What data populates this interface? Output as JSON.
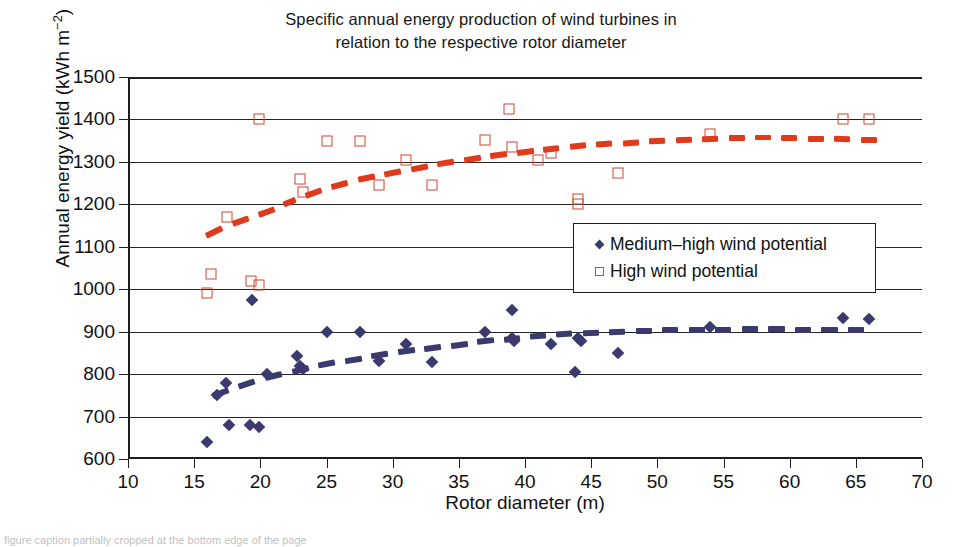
{
  "chart_data": {
    "type": "scatter",
    "title": "Specific annual energy production of wind turbines in relation to the respective rotor diameter",
    "title_lines": [
      "Specific annual energy production of wind turbines in",
      "relation to the respective rotor diameter"
    ],
    "xlabel": "Rotor diameter (m)",
    "ylabel": "Annual energy yield (kWh m⁻²)",
    "ylabel_prefix": "Annual energy yield (kWh m",
    "ylabel_sup": "−2",
    "ylabel_suffix": ")",
    "xlim": [
      10,
      70
    ],
    "ylim": [
      600,
      1500
    ],
    "xticks": [
      10,
      15,
      20,
      25,
      30,
      35,
      40,
      45,
      50,
      55,
      60,
      65,
      70
    ],
    "yticks": [
      600,
      700,
      800,
      900,
      1000,
      1100,
      1200,
      1300,
      1400,
      1500
    ],
    "grid": "horizontal",
    "legend_position": "center-right",
    "colors": {
      "medium_high": "#3a3a6e",
      "high": "#d1472c",
      "high_trend": "#e03a1c",
      "axis": "#1d1d1d"
    },
    "series": [
      {
        "name": "Medium–high wind potential",
        "marker": "filled-diamond",
        "color": "#3a3a6e",
        "points": [
          [
            16.0,
            640
          ],
          [
            16.7,
            750
          ],
          [
            17.4,
            780
          ],
          [
            17.6,
            680
          ],
          [
            19.2,
            680
          ],
          [
            19.4,
            975
          ],
          [
            19.9,
            675
          ],
          [
            20.5,
            800
          ],
          [
            22.8,
            843
          ],
          [
            23.0,
            820
          ],
          [
            23.2,
            812
          ],
          [
            25.0,
            900
          ],
          [
            27.5,
            900
          ],
          [
            29.0,
            830
          ],
          [
            31.0,
            872
          ],
          [
            33.0,
            828
          ],
          [
            37.0,
            900
          ],
          [
            39.0,
            950
          ],
          [
            39.0,
            885
          ],
          [
            39.2,
            878
          ],
          [
            42.0,
            870
          ],
          [
            43.8,
            805
          ],
          [
            44.0,
            885
          ],
          [
            44.2,
            878
          ],
          [
            47.0,
            850
          ],
          [
            54.0,
            910
          ],
          [
            64.0,
            932
          ],
          [
            66.0,
            930
          ]
        ]
      },
      {
        "name": "High wind potential",
        "marker": "open-square",
        "color": "#d1472c",
        "points": [
          [
            16.0,
            990
          ],
          [
            16.3,
            1035
          ],
          [
            17.5,
            1170
          ],
          [
            19.3,
            1020
          ],
          [
            19.9,
            1010
          ],
          [
            19.9,
            1400
          ],
          [
            23.0,
            1260
          ],
          [
            23.2,
            1228
          ],
          [
            25.0,
            1350
          ],
          [
            27.5,
            1350
          ],
          [
            29.0,
            1245
          ],
          [
            31.0,
            1305
          ],
          [
            33.0,
            1245
          ],
          [
            37.0,
            1352
          ],
          [
            38.8,
            1425
          ],
          [
            39.0,
            1335
          ],
          [
            41.0,
            1305
          ],
          [
            42.0,
            1322
          ],
          [
            44.0,
            1212
          ],
          [
            44.0,
            1200
          ],
          [
            47.0,
            1275
          ],
          [
            54.0,
            1365
          ],
          [
            64.0,
            1400
          ],
          [
            66.0,
            1400
          ]
        ]
      }
    ],
    "trendlines": [
      {
        "name": "High wind potential trend",
        "style": "dashed",
        "color": "#e03a1c",
        "points": [
          [
            15.5,
            1120
          ],
          [
            17.5,
            1150
          ],
          [
            19.5,
            1172
          ],
          [
            21.5,
            1195
          ],
          [
            23.0,
            1215
          ],
          [
            25.0,
            1238
          ],
          [
            27.0,
            1255
          ],
          [
            29.0,
            1268
          ],
          [
            31.0,
            1280
          ],
          [
            33.0,
            1292
          ],
          [
            35.0,
            1302
          ],
          [
            37.0,
            1312
          ],
          [
            39.0,
            1320
          ],
          [
            41.0,
            1328
          ],
          [
            43.0,
            1334
          ],
          [
            45.0,
            1340
          ],
          [
            47.0,
            1344
          ],
          [
            49.0,
            1348
          ],
          [
            51.0,
            1351
          ],
          [
            53.0,
            1354
          ],
          [
            55.0,
            1356
          ],
          [
            57.0,
            1357
          ],
          [
            59.0,
            1357
          ],
          [
            61.0,
            1356
          ],
          [
            63.0,
            1355
          ],
          [
            65.0,
            1353
          ],
          [
            67.0,
            1352
          ]
        ]
      },
      {
        "name": "Medium–high wind potential trend",
        "style": "dashed",
        "color": "#3a3a6e",
        "points": [
          [
            16.0,
            745
          ],
          [
            18.0,
            768
          ],
          [
            20.0,
            788
          ],
          [
            22.0,
            803
          ],
          [
            24.0,
            818
          ],
          [
            26.0,
            830
          ],
          [
            28.0,
            840
          ],
          [
            30.0,
            850
          ],
          [
            32.0,
            858
          ],
          [
            34.0,
            866
          ],
          [
            36.0,
            874
          ],
          [
            38.0,
            881
          ],
          [
            40.0,
            887
          ],
          [
            42.0,
            892
          ],
          [
            44.0,
            896
          ],
          [
            46.0,
            899
          ],
          [
            48.0,
            902
          ],
          [
            50.0,
            903
          ],
          [
            52.0,
            904
          ],
          [
            54.0,
            905
          ],
          [
            56.0,
            906
          ],
          [
            58.0,
            906
          ],
          [
            60.0,
            906
          ],
          [
            62.0,
            905
          ],
          [
            64.0,
            905
          ],
          [
            66.0,
            904
          ]
        ]
      }
    ],
    "legend": {
      "items": [
        {
          "label": "Medium–high wind potential",
          "marker": "filled-diamond",
          "color": "#3a3a6e"
        },
        {
          "label": "High wind potential",
          "marker": "open-square",
          "color": "#d1472c"
        }
      ]
    }
  },
  "caption": "figure caption partially cropped at the bottom edge of the page"
}
